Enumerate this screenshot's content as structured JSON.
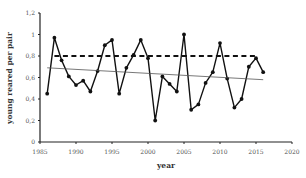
{
  "chart_data": {
    "type": "line",
    "title": "",
    "xlabel": "year",
    "ylabel": "young reared per pair",
    "xlim": [
      1985,
      2020
    ],
    "ylim": [
      0,
      1.2
    ],
    "xticks": [
      1985,
      1990,
      1995,
      2000,
      2005,
      2010,
      2015,
      2020
    ],
    "yticks": [
      0,
      0.2,
      0.4,
      0.6,
      0.8,
      1,
      1.2
    ],
    "ytick_labels": [
      "0",
      "0,2",
      "0,4",
      "0,6",
      "0,8",
      "1",
      "1,2"
    ],
    "grid": false,
    "legend": null,
    "series": [
      {
        "name": "young reared per pair",
        "style": "solid-line-with-markers",
        "color": "#111111",
        "x": [
          1986,
          1987,
          1988,
          1989,
          1990,
          1991,
          1992,
          1993,
          1994,
          1995,
          1996,
          1997,
          1998,
          1999,
          2000,
          2001,
          2002,
          2003,
          2004,
          2005,
          2006,
          2007,
          2008,
          2009,
          2010,
          2011,
          2012,
          2013,
          2014,
          2015,
          2016
        ],
        "values": [
          0.45,
          0.97,
          0.76,
          0.61,
          0.53,
          0.57,
          0.47,
          0.66,
          0.9,
          0.95,
          0.45,
          0.69,
          0.81,
          0.95,
          0.78,
          0.2,
          0.61,
          0.54,
          0.47,
          1.0,
          0.3,
          0.35,
          0.55,
          0.65,
          0.92,
          0.59,
          0.32,
          0.4,
          0.7,
          0.78,
          0.65
        ]
      },
      {
        "name": "reference level",
        "style": "dashed",
        "color": "#111111",
        "x": [
          1987,
          2015
        ],
        "values": [
          0.8,
          0.8
        ]
      },
      {
        "name": "linear trend",
        "style": "thin-solid",
        "color": "#555555",
        "x": [
          1986,
          2016
        ],
        "values": [
          0.69,
          0.58
        ]
      }
    ]
  }
}
